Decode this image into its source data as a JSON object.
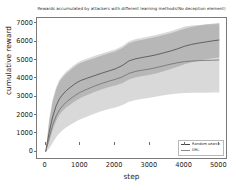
{
  "chart_data": {
    "type": "line",
    "title": "Rewards accumulated by attackers with different learning methods(No deception element)",
    "xlabel": "step",
    "ylabel": "cumulative reward",
    "xlim": [
      -250,
      5250
    ],
    "ylim": [
      -450,
      7300
    ],
    "xticks": [
      0,
      1000,
      2000,
      3000,
      4000,
      5000
    ],
    "yticks": [
      0,
      1000,
      2000,
      3000,
      4000,
      5000,
      6000,
      7000
    ],
    "xtick_labels": [
      "0",
      "1000",
      "2000",
      "3000",
      "4000",
      "5000"
    ],
    "ytick_labels": [
      "0",
      "1000",
      "2000",
      "3000",
      "4000",
      "5000",
      "6000",
      "7000"
    ],
    "grid": false,
    "legend_position": "lower right",
    "x": [
      0,
      100,
      200,
      300,
      400,
      500,
      600,
      700,
      800,
      900,
      1000,
      1200,
      1400,
      1600,
      1800,
      2000,
      2200,
      2400,
      2600,
      2800,
      3000,
      3200,
      3400,
      3600,
      3800,
      4000,
      4200,
      4400,
      4600,
      4800,
      5000
    ],
    "series": [
      {
        "name": "Random search",
        "color": "#4a4a4a",
        "band_color": "#9a9a9a",
        "band_opacity": 0.55,
        "values": [
          0,
          1050,
          1900,
          2500,
          2900,
          3150,
          3350,
          3500,
          3650,
          3780,
          3880,
          4020,
          4150,
          4280,
          4400,
          4520,
          4700,
          4960,
          5080,
          5150,
          5220,
          5300,
          5400,
          5500,
          5620,
          5760,
          5860,
          5930,
          5990,
          6050,
          6100
        ],
        "band_low": [
          0,
          520,
          1180,
          1680,
          2030,
          2250,
          2430,
          2560,
          2700,
          2830,
          2930,
          3100,
          3260,
          3400,
          3520,
          3620,
          3740,
          3950,
          4060,
          4130,
          4200,
          4290,
          4400,
          4510,
          4640,
          4780,
          4880,
          4960,
          5030,
          5100,
          5150
        ],
        "band_high": [
          0,
          1640,
          2720,
          3400,
          3830,
          4080,
          4280,
          4440,
          4600,
          4740,
          4840,
          4980,
          5110,
          5240,
          5360,
          5470,
          5650,
          5920,
          6040,
          6110,
          6190,
          6270,
          6370,
          6470,
          6590,
          6720,
          6810,
          6880,
          6940,
          6990,
          7030
        ]
      },
      {
        "name": "DRL",
        "color": "#6e6e6e",
        "band_color": "#cfcfcf",
        "band_opacity": 0.8,
        "values": [
          0,
          780,
          1450,
          1950,
          2300,
          2530,
          2720,
          2870,
          3010,
          3140,
          3250,
          3420,
          3580,
          3720,
          3840,
          3950,
          4080,
          4280,
          4390,
          4460,
          4520,
          4600,
          4690,
          4780,
          4860,
          4920,
          4950,
          4970,
          4985,
          4995,
          5010
        ],
        "band_low": [
          0,
          180,
          480,
          790,
          1030,
          1200,
          1340,
          1460,
          1570,
          1680,
          1770,
          1930,
          2080,
          2210,
          2320,
          2420,
          2540,
          2730,
          2830,
          2890,
          2950,
          3020,
          3090,
          3140,
          3180,
          3205,
          3215,
          3220,
          3225,
          3228,
          3230
        ],
        "band_high": [
          0,
          1780,
          2860,
          3520,
          3940,
          4190,
          4390,
          4550,
          4710,
          4850,
          4950,
          5090,
          5220,
          5350,
          5470,
          5580,
          5760,
          6030,
          6150,
          6220,
          6300,
          6380,
          6480,
          6580,
          6700,
          6830,
          6890,
          6920,
          6940,
          6950,
          6960
        ]
      }
    ]
  },
  "legend": {
    "items": [
      {
        "label": "Random search"
      },
      {
        "label": "DRL"
      }
    ]
  }
}
